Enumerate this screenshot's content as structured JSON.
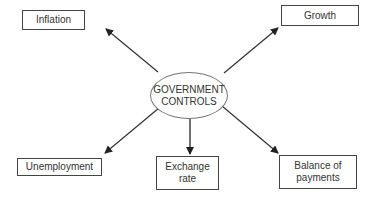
{
  "diagram": {
    "center": {
      "line1": "GOVERNMENT",
      "line2": "CONTROLS"
    },
    "nodes": {
      "inflation": {
        "label": "Inflation"
      },
      "growth": {
        "label": "Growth"
      },
      "unemployment": {
        "label": "Unemployment"
      },
      "exchange_rate": {
        "line1": "Exchange",
        "line2": "rate"
      },
      "balance_of_payments": {
        "line1": "Balance of",
        "line2": "payments"
      }
    },
    "edges": [
      {
        "from": "GOVERNMENT CONTROLS",
        "to": "Inflation"
      },
      {
        "from": "GOVERNMENT CONTROLS",
        "to": "Growth"
      },
      {
        "from": "GOVERNMENT CONTROLS",
        "to": "Unemployment"
      },
      {
        "from": "GOVERNMENT CONTROLS",
        "to": "Exchange rate"
      },
      {
        "from": "GOVERNMENT CONTROLS",
        "to": "Balance of payments"
      }
    ],
    "colors": {
      "line": "#333333",
      "box_border": "#444444",
      "ellipse_border": "#777777"
    }
  }
}
